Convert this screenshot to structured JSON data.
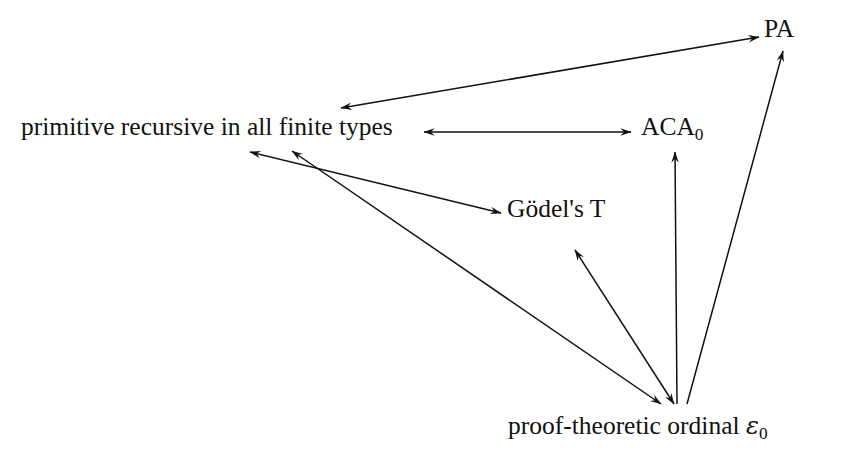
{
  "diagram": {
    "background_color": "#ffffff",
    "ink_color": "#111111",
    "nodes": [
      {
        "id": "primitive-recursive",
        "label": "primitive recursive in all finite types",
        "x": 21,
        "y": 132
      },
      {
        "id": "aca0",
        "label": "ACA",
        "subscript": "0",
        "full_label": "ACA0",
        "x": 641,
        "y": 132
      },
      {
        "id": "pa",
        "label": "PA",
        "x": 764,
        "y": 34
      },
      {
        "id": "godels-t",
        "label": "Gödel's T",
        "x": 507,
        "y": 214
      },
      {
        "id": "epsilon0",
        "label": "proof-theoretic ordinal ",
        "symbol": "ε",
        "subscript": "0",
        "full_label": "proof-theoretic ordinal ε0",
        "x": 508,
        "y": 431
      }
    ],
    "edges": [
      {
        "id": "edge-primitive-recursive-pa",
        "from": "primitive-recursive",
        "to": "pa",
        "arrowheads": "both",
        "x1": 341,
        "y1": 108,
        "x2": 759,
        "y2": 37
      },
      {
        "id": "edge-primitive-recursive-aca0",
        "from": "primitive-recursive",
        "to": "aca0",
        "arrowheads": "both",
        "x1": 424,
        "y1": 132,
        "x2": 631,
        "y2": 132
      },
      {
        "id": "edge-primitive-recursive-godels-t",
        "from": "primitive-recursive",
        "to": "godels-t",
        "arrowheads": "both",
        "x1": 250,
        "y1": 152,
        "x2": 501,
        "y2": 213
      },
      {
        "id": "edge-primitive-recursive-epsilon0",
        "from": "primitive-recursive",
        "to": "epsilon0",
        "arrowheads": "both",
        "x1": 292,
        "y1": 151,
        "x2": 661,
        "y2": 404
      },
      {
        "id": "edge-godels-t-epsilon0",
        "from": "godels-t",
        "to": "godels-t",
        "arrowheads": "both",
        "x1": 575,
        "y1": 250,
        "x2": 674,
        "y2": 404
      },
      {
        "id": "edge-epsilon0-aca0",
        "from": "epsilon0",
        "to": "aca0",
        "arrowheads": "up",
        "x1": 677,
        "y1": 404,
        "x2": 675,
        "y2": 152
      },
      {
        "id": "edge-epsilon0-pa",
        "from": "epsilon0",
        "to": "pa",
        "arrowheads": "up",
        "x1": 687,
        "y1": 404,
        "x2": 783,
        "y2": 51
      }
    ]
  }
}
